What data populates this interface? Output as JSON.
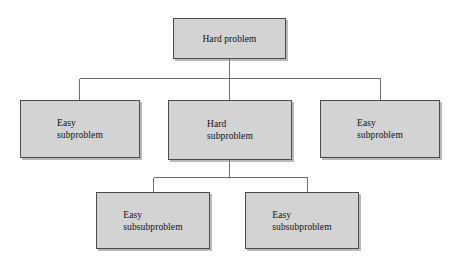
{
  "diagram": {
    "type": "tree",
    "background_color": "#ffffff",
    "node_fill_color": "#d3d3d3",
    "node_border_color": "#4a4a4a",
    "connector_color": "#6e6e6e",
    "nodes": [
      {
        "id": "root",
        "label": "Hard problem",
        "level": 0,
        "x": 173,
        "y": 18,
        "width": 113,
        "height": 41,
        "align": "centered"
      },
      {
        "id": "left-sub",
        "label": "Easy\nsubproblem",
        "level": 1,
        "x": 20,
        "y": 100,
        "width": 120,
        "height": 58,
        "align": "left"
      },
      {
        "id": "mid-sub",
        "label": "Hard\nsubproblem",
        "level": 1,
        "x": 168,
        "y": 100,
        "width": 124,
        "height": 60,
        "align": "left"
      },
      {
        "id": "right-sub",
        "label": "Easy\nsubproblem",
        "level": 1,
        "x": 320,
        "y": 100,
        "width": 120,
        "height": 58,
        "align": "left"
      },
      {
        "id": "left-subsub",
        "label": "Easy\nsubsubproblem",
        "level": 2,
        "x": 96,
        "y": 192,
        "width": 114,
        "height": 57,
        "align": "left"
      },
      {
        "id": "right-subsub",
        "label": "Easy\nsubsubproblem",
        "level": 2,
        "x": 245,
        "y": 192,
        "width": 114,
        "height": 57,
        "align": "left"
      }
    ],
    "edges": [
      {
        "id": "root-to-bus",
        "from": "root",
        "to": "bus-upper",
        "path": "M 229.5 59 L 229.5 78"
      },
      {
        "id": "bus-upper",
        "from": "root",
        "to": "level-1",
        "path": "M 79 78 L 380 78"
      },
      {
        "id": "bus-to-left-sub",
        "from": "bus-upper",
        "to": "left-sub",
        "path": "M 79 78 L 79 100"
      },
      {
        "id": "bus-to-mid-sub",
        "from": "bus-upper",
        "to": "mid-sub",
        "path": "M 229.5 78 L 229.5 100"
      },
      {
        "id": "bus-to-right-sub",
        "from": "bus-upper",
        "to": "right-sub",
        "path": "M 380 78 L 380 100"
      },
      {
        "id": "mid-sub-to-bus",
        "from": "mid-sub",
        "to": "bus-lower",
        "path": "M 229.5 160 L 229.5 177"
      },
      {
        "id": "bus-lower",
        "from": "mid-sub",
        "to": "level-2",
        "path": "M 153 177 L 307 177"
      },
      {
        "id": "bus-to-left-subsub",
        "from": "bus-lower",
        "to": "left-subsub",
        "path": "M 153 177 L 153 192"
      },
      {
        "id": "bus-to-right-subsub",
        "from": "bus-lower",
        "to": "right-subsub",
        "path": "M 307 177 L 307 192"
      }
    ]
  }
}
